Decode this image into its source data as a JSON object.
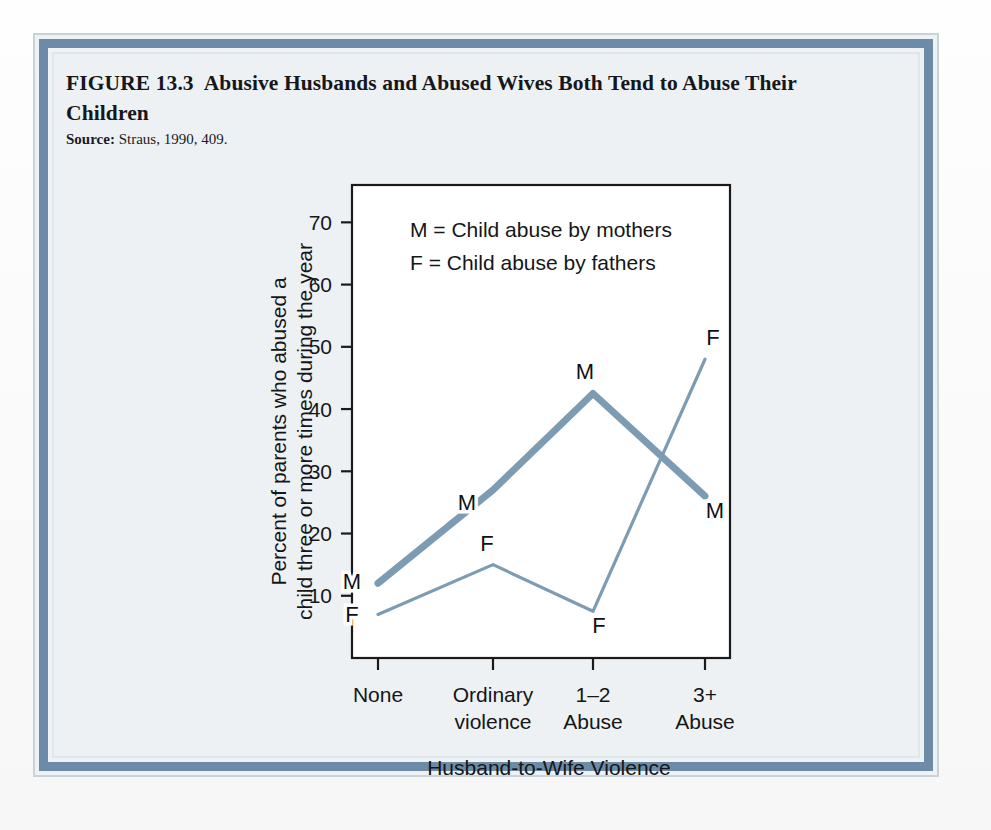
{
  "figure": {
    "number": "FIGURE 13.3",
    "title": "Abusive Husbands and Abused Wives Both Tend to Abuse Their Children",
    "source_label": "Source:",
    "source_text": "Straus, 1990, 409."
  },
  "colors": {
    "border_band": "#6b8ba6",
    "line_series": "#7d9cb3",
    "plot_frame": "#1a1a1a",
    "page_bg": "#eef1f3"
  },
  "chart_data": {
    "type": "line",
    "title": "",
    "xlabel": "Husband-to-Wife Violence",
    "ylabel": "Percent of parents who abused a child three or more times during the year",
    "categories": [
      "None",
      "Ordinary violence",
      "1–2 Abuse",
      "3+ Abuse"
    ],
    "category_lines": [
      [
        "None"
      ],
      [
        "Ordinary",
        "violence"
      ],
      [
        "1–2",
        "Abuse"
      ],
      [
        "3+",
        "Abuse"
      ]
    ],
    "yticks": [
      10,
      20,
      30,
      40,
      50,
      60,
      70
    ],
    "ylim": [
      0,
      76
    ],
    "grid": false,
    "legend_position": "top-left-inside",
    "series": [
      {
        "name": "M",
        "legend": "M = Child abuse by mothers",
        "marker_label": "M",
        "values": [
          12,
          27,
          42.5,
          26
        ],
        "stroke_width": 7
      },
      {
        "name": "F",
        "legend": "F = Child abuse by fathers",
        "marker_label": "F",
        "values": [
          7,
          15,
          7.5,
          48
        ],
        "stroke_width": 3.2
      }
    ],
    "point_labels": [
      {
        "series": "M",
        "text": "M",
        "category": "None",
        "value": 12,
        "dx": -26,
        "dy": 6
      },
      {
        "series": "M",
        "text": "M",
        "category": "Ordinary violence",
        "value": 27,
        "dx": -26,
        "dy": 20
      },
      {
        "series": "M",
        "text": "M",
        "category": "1–2 Abuse",
        "value": 42.5,
        "dx": -8,
        "dy": -14
      },
      {
        "series": "M",
        "text": "M",
        "category": "3+ Abuse",
        "value": 26,
        "dx": 10,
        "dy": 22
      },
      {
        "series": "F",
        "text": "F",
        "category": "None",
        "value": 7,
        "dx": -26,
        "dy": 8
      },
      {
        "series": "F",
        "text": "F",
        "category": "Ordinary violence",
        "value": 15,
        "dx": -6,
        "dy": -14
      },
      {
        "series": "F",
        "text": "F",
        "category": "1–2 Abuse",
        "value": 7.5,
        "dx": 6,
        "dy": 22
      },
      {
        "series": "F",
        "text": "F",
        "category": "3+ Abuse",
        "value": 48,
        "dx": 8,
        "dy": -14
      }
    ]
  }
}
